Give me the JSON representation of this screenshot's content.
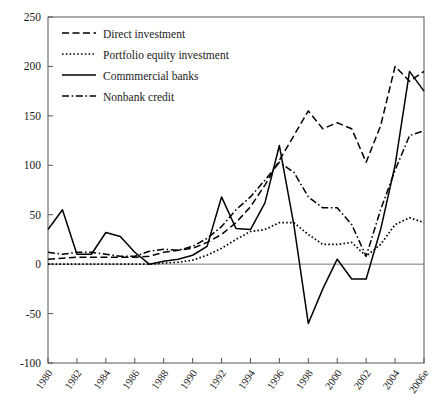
{
  "figure": {
    "cropped_title_fragment": "",
    "ylabel": "",
    "xlabel": ""
  },
  "legend": {
    "position": "top-left-inside",
    "entries": [
      {
        "label": "Direct investment",
        "style": "dashed",
        "icon": "dashed-line-swatch"
      },
      {
        "label": "Portfolio equity investment",
        "style": "dotted",
        "icon": "dotted-line-swatch"
      },
      {
        "label": "Commmercial banks",
        "style": "solid",
        "icon": "solid-line-swatch"
      },
      {
        "label": "Nonbank credit",
        "style": "dashdot",
        "icon": "dashdot-line-swatch"
      }
    ]
  },
  "chart_data": {
    "type": "line",
    "title": "",
    "xlabel": "",
    "ylabel": "",
    "xlim": [
      1980,
      2006
    ],
    "ylim": [
      -100,
      250
    ],
    "ytick_values": [
      250,
      200,
      150,
      100,
      50,
      0,
      -50,
      -100
    ],
    "ytick_labels": [
      "250",
      "200",
      "150",
      "100",
      "50",
      "0",
      "-50",
      "-100"
    ],
    "xtick_values": [
      1980,
      1982,
      1984,
      1986,
      1988,
      1990,
      1992,
      1994,
      1996,
      1998,
      2000,
      2002,
      2004,
      2006
    ],
    "xtick_labels": [
      "1980",
      "1982",
      "1984",
      "1986",
      "1988",
      "1990",
      "1992",
      "1994",
      "1996",
      "1998",
      "2000",
      "2002",
      "2004",
      "2006e"
    ],
    "grid": false,
    "zero_line": true,
    "x": [
      1980,
      1981,
      1982,
      1983,
      1984,
      1985,
      1986,
      1987,
      1988,
      1989,
      1990,
      1991,
      1992,
      1993,
      1994,
      1995,
      1996,
      1997,
      1998,
      1999,
      2000,
      2001,
      2002,
      2003,
      2004,
      2005,
      2006
    ],
    "series": [
      {
        "name": "Direct investment",
        "style": "dashed",
        "values": [
          5,
          6,
          7,
          7,
          7,
          7,
          7,
          8,
          12,
          14,
          16,
          22,
          30,
          42,
          58,
          80,
          105,
          130,
          155,
          137,
          143,
          137,
          103,
          140,
          200,
          185,
          195
        ]
      },
      {
        "name": "Portfolio equity investment",
        "style": "dotted",
        "values": [
          0,
          0,
          0,
          0,
          0,
          0,
          0,
          0,
          1,
          2,
          4,
          9,
          16,
          25,
          33,
          35,
          42,
          42,
          30,
          20,
          20,
          22,
          8,
          20,
          40,
          47,
          42
        ]
      },
      {
        "name": "Commmercial banks",
        "style": "solid",
        "values": [
          35,
          55,
          10,
          10,
          32,
          28,
          12,
          0,
          3,
          5,
          9,
          18,
          68,
          36,
          35,
          62,
          120,
          40,
          -60,
          -25,
          5,
          -15,
          -15,
          35,
          100,
          195,
          175
        ]
      },
      {
        "name": "Nonbank credit",
        "style": "dashdot",
        "values": [
          12,
          10,
          12,
          12,
          10,
          8,
          8,
          13,
          15,
          14,
          18,
          26,
          38,
          55,
          68,
          85,
          103,
          93,
          68,
          57,
          57,
          40,
          8,
          55,
          95,
          130,
          135
        ]
      }
    ]
  }
}
